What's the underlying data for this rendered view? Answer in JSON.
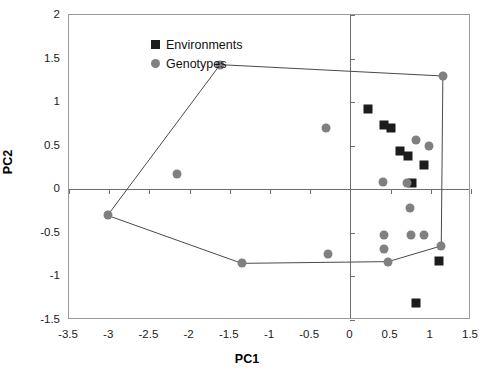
{
  "chart_data": {
    "type": "scatter",
    "title": "",
    "xlabel": "PC1",
    "ylabel": "PC2",
    "xlim": [
      -3.5,
      1.5
    ],
    "ylim": [
      -1.5,
      2
    ],
    "xticks": [
      -3.5,
      -3,
      -2.5,
      -2,
      -1.5,
      -1,
      -0.5,
      0,
      0.5,
      1,
      1.5
    ],
    "xticklabels": [
      "-3.5",
      "-3",
      "-2.5",
      "-2",
      "-1.5",
      "-1",
      "-0.5",
      "0",
      "0.5",
      "1",
      "1.5"
    ],
    "yticks": [
      -1.5,
      -1,
      -0.5,
      0,
      0.5,
      1,
      1.5,
      2
    ],
    "yticklabels": [
      "-1.5",
      "-1",
      "-0.5",
      "0",
      "0.5",
      "1",
      "1.5",
      "2"
    ],
    "grid": false,
    "legend_position": "upper-left",
    "series": [
      {
        "name": "Environments",
        "marker": "square",
        "color": "#1c1c1c",
        "points": [
          {
            "x": 0.22,
            "y": 0.92
          },
          {
            "x": 0.42,
            "y": 0.74
          },
          {
            "x": 0.5,
            "y": 0.7
          },
          {
            "x": 0.62,
            "y": 0.44
          },
          {
            "x": 0.72,
            "y": 0.38
          },
          {
            "x": 0.92,
            "y": 0.28
          },
          {
            "x": 0.76,
            "y": 0.07
          },
          {
            "x": 1.1,
            "y": -0.82
          },
          {
            "x": 0.82,
            "y": -1.3
          }
        ]
      },
      {
        "name": "Genotypes",
        "marker": "circle",
        "color": "#808080",
        "points": [
          {
            "x": -1.62,
            "y": 1.43
          },
          {
            "x": 1.15,
            "y": 1.3
          },
          {
            "x": -0.3,
            "y": 0.7
          },
          {
            "x": -2.16,
            "y": 0.18
          },
          {
            "x": 0.82,
            "y": 0.57
          },
          {
            "x": 0.98,
            "y": 0.5
          },
          {
            "x": 0.4,
            "y": 0.08
          },
          {
            "x": 0.7,
            "y": 0.07
          },
          {
            "x": 0.74,
            "y": -0.22
          },
          {
            "x": -3.02,
            "y": -0.3
          },
          {
            "x": 0.42,
            "y": -0.52
          },
          {
            "x": 0.75,
            "y": -0.52
          },
          {
            "x": 0.92,
            "y": -0.52
          },
          {
            "x": 0.42,
            "y": -0.68
          },
          {
            "x": -0.28,
            "y": -0.74
          },
          {
            "x": 0.47,
            "y": -0.83
          },
          {
            "x": -1.35,
            "y": -0.85
          },
          {
            "x": 1.13,
            "y": -0.65
          }
        ]
      }
    ],
    "hull": {
      "name": "genotype-convex-hull",
      "color": "#4a4a4a",
      "vertices": [
        {
          "x": -3.02,
          "y": -0.3
        },
        {
          "x": -1.62,
          "y": 1.43
        },
        {
          "x": 1.15,
          "y": 1.3
        },
        {
          "x": 1.13,
          "y": -0.65
        },
        {
          "x": 0.47,
          "y": -0.83
        },
        {
          "x": -1.35,
          "y": -0.85
        }
      ]
    }
  },
  "legend": {
    "items": [
      {
        "label": "Environments",
        "marker": "square"
      },
      {
        "label": "Genotypes",
        "marker": "circle"
      }
    ]
  }
}
